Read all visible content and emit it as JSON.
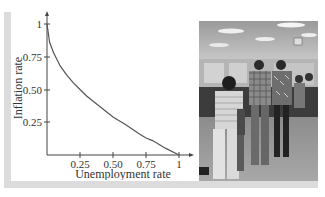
{
  "chart_data": {
    "type": "line",
    "title": "",
    "xlabel": "Unemployment rate",
    "ylabel": "Inflation rate",
    "xlim": [
      0,
      1
    ],
    "ylim": [
      0,
      1
    ],
    "x_ticks": [
      "0.25",
      "0.50",
      "0.75",
      "1"
    ],
    "y_ticks": [
      "0.25",
      "0.50",
      "0.75",
      "1"
    ],
    "grid": false,
    "legend": null,
    "series": [
      {
        "name": "Phillips curve",
        "x": [
          0,
          0.02,
          0.05,
          0.1,
          0.15,
          0.2,
          0.25,
          0.3,
          0.4,
          0.5,
          0.6,
          0.7,
          0.75,
          0.8,
          0.9,
          1.0
        ],
        "values": [
          1,
          0.86,
          0.78,
          0.68,
          0.61,
          0.55,
          0.5,
          0.45,
          0.37,
          0.29,
          0.23,
          0.16,
          0.13,
          0.11,
          0.05,
          0
        ]
      }
    ]
  },
  "labels": {
    "x_axis_title": "Unemployment rate",
    "y_axis_title": "Inflation rate",
    "x_tick_1": "0.25",
    "x_tick_2": "0.50",
    "x_tick_3": "0.75",
    "x_tick_4": "1",
    "y_tick_1": "0.25",
    "y_tick_2": "0.50",
    "y_tick_3": "0.75",
    "y_tick_4": "1"
  },
  "photo": {
    "description": "Black-and-white photo of people standing in line at service counters"
  },
  "colors": {
    "frame": "#dcdcdc",
    "axis": "#444444",
    "curve": "#555555"
  }
}
